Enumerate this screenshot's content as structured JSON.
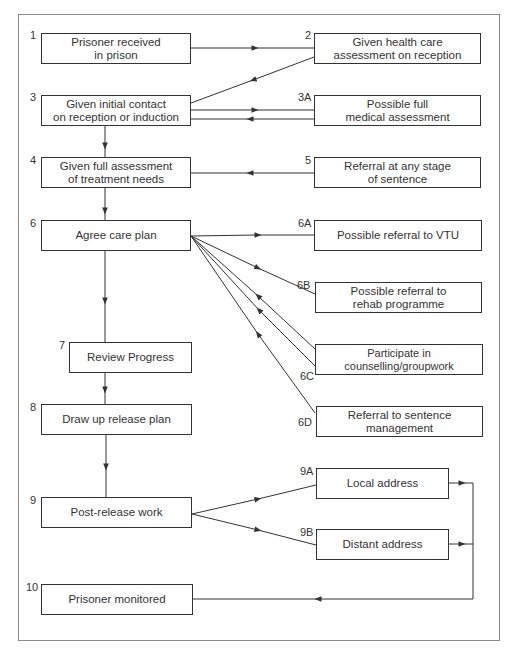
{
  "diagram": {
    "type": "flowchart",
    "title": "",
    "nodes": [
      {
        "id": "1",
        "number": "1",
        "label": "Prisoner received\nin prison"
      },
      {
        "id": "2",
        "number": "2",
        "label": "Given health care\nassessment on reception"
      },
      {
        "id": "3",
        "number": "3",
        "label": "Given initial contact\non reception or induction"
      },
      {
        "id": "3A",
        "number": "3A",
        "label": "Possible full\nmedical assessment"
      },
      {
        "id": "4",
        "number": "4",
        "label": "Given full assessment\nof treatment needs"
      },
      {
        "id": "5",
        "number": "5",
        "label": "Referral at any stage\nof sentence"
      },
      {
        "id": "6",
        "number": "6",
        "label": "Agree care plan"
      },
      {
        "id": "6A",
        "number": "6A",
        "label": "Possible referral to VTU"
      },
      {
        "id": "6B",
        "number": "6B",
        "label": "Possible referral to\nrehab programme"
      },
      {
        "id": "6C",
        "number": "6C",
        "label": "Participate in counselling/groupwork"
      },
      {
        "id": "6D",
        "number": "6D",
        "label": "Referral to sentence management"
      },
      {
        "id": "7",
        "number": "7",
        "label": "Review Progress"
      },
      {
        "id": "8",
        "number": "8",
        "label": "Draw up release plan"
      },
      {
        "id": "9",
        "number": "9",
        "label": "Post-release work"
      },
      {
        "id": "9A",
        "number": "9A",
        "label": "Local address"
      },
      {
        "id": "9B",
        "number": "9B",
        "label": "Distant address"
      },
      {
        "id": "10",
        "number": "10",
        "label": "Prisoner monitored"
      }
    ],
    "edges": [
      {
        "from": "1",
        "to": "2"
      },
      {
        "from": "2",
        "to": "3"
      },
      {
        "from": "3",
        "to": "3A"
      },
      {
        "from": "3A",
        "to": "3"
      },
      {
        "from": "3",
        "to": "4"
      },
      {
        "from": "5",
        "to": "4"
      },
      {
        "from": "4",
        "to": "6"
      },
      {
        "from": "6",
        "to": "6A"
      },
      {
        "from": "6",
        "to": "6B"
      },
      {
        "from": "6C",
        "to": "6"
      },
      {
        "from": "6C",
        "to": "6"
      },
      {
        "from": "6D",
        "to": "6"
      },
      {
        "from": "6",
        "to": "7"
      },
      {
        "from": "7",
        "to": "8"
      },
      {
        "from": "8",
        "to": "9"
      },
      {
        "from": "9",
        "to": "9A"
      },
      {
        "from": "9",
        "to": "9B"
      },
      {
        "from": "9A",
        "to": "10"
      },
      {
        "from": "9B",
        "to": "10"
      }
    ],
    "colors": {
      "line": "#333333",
      "frame": "#8a8a8a",
      "background": "#ffffff"
    }
  }
}
